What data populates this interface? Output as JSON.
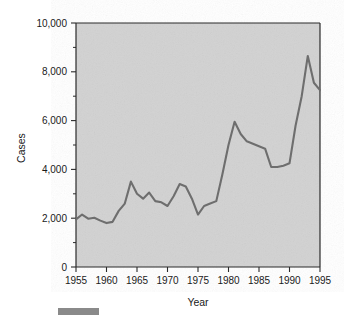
{
  "figure": {
    "background_color": "#ffffff",
    "plot_background_color": "#d2d2d2",
    "line_color": "#6e6e6e",
    "axis_color": "#2b2b2b",
    "footer_bar_color": "#8a8a8a"
  },
  "axes": {
    "y_title": "Cases",
    "x_title": "Year",
    "y_tick_labels": [
      "0",
      "2,000",
      "4,000",
      "6,000",
      "8,000",
      "10,000"
    ],
    "x_tick_labels": [
      "1955",
      "1960",
      "1965",
      "1970",
      "1975",
      "1980",
      "1985",
      "1990",
      "1995"
    ]
  },
  "chart_data": {
    "type": "line",
    "title": "",
    "xlabel": "Year",
    "ylabel": "Cases",
    "xlim": [
      1955,
      1995
    ],
    "ylim": [
      0,
      10000
    ],
    "grid": false,
    "legend": false,
    "x_ticks": [
      1955,
      1960,
      1965,
      1970,
      1975,
      1980,
      1985,
      1990,
      1995
    ],
    "y_ticks": [
      0,
      2000,
      4000,
      6000,
      8000,
      10000
    ],
    "y_minor_ticks": [
      1000,
      3000,
      5000,
      7000,
      9000
    ],
    "series": [
      {
        "name": "Cases",
        "color": "#6e6e6e",
        "x": [
          1955,
          1956,
          1957,
          1958,
          1959,
          1960,
          1961,
          1962,
          1963,
          1964,
          1965,
          1966,
          1967,
          1968,
          1969,
          1970,
          1971,
          1972,
          1973,
          1974,
          1975,
          1976,
          1977,
          1978,
          1979,
          1980,
          1981,
          1982,
          1983,
          1984,
          1985,
          1986,
          1987,
          1988,
          1989,
          1990,
          1991,
          1992,
          1993,
          1994,
          1995
        ],
        "values": [
          1950,
          2150,
          1980,
          2020,
          1900,
          1800,
          1850,
          2300,
          2600,
          3500,
          3000,
          2800,
          3050,
          2700,
          2650,
          2500,
          2900,
          3400,
          3300,
          2800,
          2150,
          2500,
          2600,
          2700,
          3800,
          5000,
          5950,
          5450,
          5150,
          5050,
          4950,
          4850,
          4100,
          4100,
          4150,
          4250,
          5800,
          7000,
          8650,
          7550,
          7250
        ]
      }
    ]
  }
}
